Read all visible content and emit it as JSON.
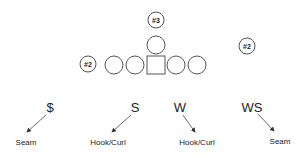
{
  "diagram": {
    "type": "football-formation",
    "offense": {
      "receivers": [
        {
          "id": "rec-3",
          "label": "#3",
          "x": 156,
          "y": 20
        },
        {
          "id": "rec-2-left",
          "label": "#2",
          "x": 88,
          "y": 64
        },
        {
          "id": "rec-2-right",
          "label": "#2",
          "x": 247,
          "y": 46
        }
      ],
      "linemen_x": [
        113,
        134,
        177,
        198
      ],
      "center": {
        "x": 156,
        "y": 64
      },
      "quarterback": {
        "x": 156,
        "y": 45
      }
    },
    "defenders": [
      {
        "label": "$",
        "zone": "Seam"
      },
      {
        "label": "S",
        "zone": "Hook/Curl"
      },
      {
        "label": "W",
        "zone": "Hook/Curl"
      },
      {
        "label": "WS",
        "zone": "Seam"
      }
    ]
  }
}
